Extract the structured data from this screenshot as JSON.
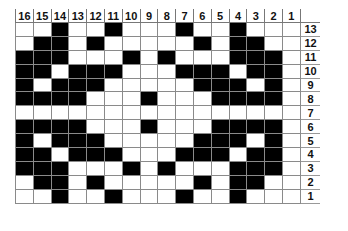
{
  "chart_data": {
    "type": "table",
    "title": "",
    "column_labels": [
      "16",
      "15",
      "14",
      "13",
      "12",
      "11",
      "10",
      "9",
      "8",
      "7",
      "6",
      "5",
      "4",
      "3",
      "2",
      "1"
    ],
    "row_labels": [
      "13",
      "12",
      "11",
      "10",
      "9",
      "8",
      "7",
      "6",
      "5",
      "4",
      "3",
      "2",
      "1"
    ],
    "colors": {
      "filled": "#000000",
      "empty": "#ffffff",
      "grid": "#8a8a8a"
    },
    "rows": [
      [
        0,
        0,
        1,
        0,
        0,
        1,
        0,
        0,
        0,
        1,
        0,
        0,
        1,
        0,
        0,
        0
      ],
      [
        0,
        1,
        1,
        0,
        1,
        0,
        0,
        0,
        0,
        0,
        1,
        0,
        1,
        1,
        0,
        0
      ],
      [
        1,
        1,
        1,
        0,
        0,
        0,
        1,
        0,
        1,
        0,
        0,
        0,
        1,
        1,
        1,
        0
      ],
      [
        1,
        1,
        0,
        1,
        1,
        1,
        0,
        0,
        0,
        1,
        1,
        1,
        0,
        1,
        1,
        0
      ],
      [
        1,
        0,
        1,
        1,
        1,
        0,
        0,
        0,
        0,
        0,
        1,
        1,
        1,
        0,
        1,
        0
      ],
      [
        1,
        1,
        1,
        1,
        0,
        0,
        0,
        1,
        0,
        0,
        0,
        1,
        1,
        1,
        1,
        0
      ],
      [
        0,
        0,
        0,
        0,
        0,
        0,
        0,
        0,
        0,
        0,
        0,
        0,
        0,
        0,
        0,
        0
      ],
      [
        1,
        1,
        1,
        1,
        0,
        0,
        0,
        1,
        0,
        0,
        0,
        1,
        1,
        1,
        1,
        0
      ],
      [
        1,
        0,
        1,
        1,
        1,
        0,
        0,
        0,
        0,
        0,
        1,
        1,
        1,
        0,
        1,
        0
      ],
      [
        1,
        1,
        0,
        1,
        1,
        1,
        0,
        0,
        0,
        1,
        1,
        1,
        0,
        1,
        1,
        0
      ],
      [
        1,
        1,
        1,
        0,
        0,
        0,
        1,
        0,
        1,
        0,
        0,
        0,
        1,
        1,
        1,
        0
      ],
      [
        0,
        1,
        1,
        0,
        1,
        0,
        0,
        0,
        0,
        0,
        1,
        0,
        1,
        1,
        0,
        0
      ],
      [
        0,
        0,
        1,
        0,
        0,
        1,
        0,
        0,
        0,
        1,
        0,
        0,
        1,
        0,
        0,
        0
      ]
    ]
  }
}
